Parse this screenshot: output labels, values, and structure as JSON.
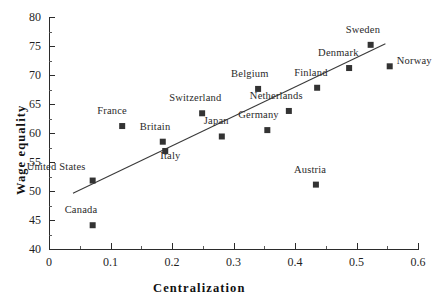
{
  "chart_data": {
    "type": "scatter",
    "title": "",
    "xlabel": "Centralization",
    "ylabel": "Wage equality",
    "xlim": [
      0,
      0.6
    ],
    "ylim": [
      40,
      80
    ],
    "xticks": [
      "0",
      "0.1",
      "0.2",
      "0.3",
      "0.4",
      "0.5",
      "0.6"
    ],
    "xtick_values": [
      0,
      0.1,
      0.2,
      0.3,
      0.4,
      0.5,
      0.6
    ],
    "yticks": [
      "40",
      "45",
      "50",
      "55",
      "60",
      "65",
      "70",
      "75",
      "80"
    ],
    "ytick_values": [
      40,
      45,
      50,
      55,
      60,
      65,
      70,
      75,
      80
    ],
    "minor_ticks": true,
    "grid": false,
    "legend": "none",
    "marker_color": "#333333",
    "trendline": {
      "x": [
        0.039,
        0.547
      ],
      "y": [
        49.6,
        75.4
      ]
    },
    "points": [
      {
        "label": "Canada",
        "x": 0.071,
        "y": 44.1,
        "label_dx": -28,
        "label_dy": -14
      },
      {
        "label": "United States",
        "x": 0.071,
        "y": 51.8,
        "label_dx": -66,
        "label_dy": -13
      },
      {
        "label": "France",
        "x": 0.119,
        "y": 61.2,
        "label_dx": -25,
        "label_dy": -14
      },
      {
        "label": "Britain",
        "x": 0.185,
        "y": 58.5,
        "label_dx": -23,
        "label_dy": -14
      },
      {
        "label": "Italy",
        "x": 0.189,
        "y": 56.9,
        "label_dx": -5,
        "label_dy": 6
      },
      {
        "label": "Switzerland",
        "x": 0.249,
        "y": 63.4,
        "label_dx": -33,
        "label_dy": -14
      },
      {
        "label": "Japan",
        "x": 0.281,
        "y": 59.4,
        "label_dx": -18,
        "label_dy": -14
      },
      {
        "label": "Belgium",
        "x": 0.34,
        "y": 67.6,
        "label_dx": -27,
        "label_dy": -14
      },
      {
        "label": "Germany",
        "x": 0.355,
        "y": 60.5,
        "label_dx": -29,
        "label_dy": -14
      },
      {
        "label": "Netherlands",
        "x": 0.39,
        "y": 63.8,
        "label_dx": -39,
        "label_dy": -14
      },
      {
        "label": "Austria",
        "x": 0.434,
        "y": 51.1,
        "label_dx": -22,
        "label_dy": -14
      },
      {
        "label": "Finland",
        "x": 0.436,
        "y": 67.8,
        "label_dx": -23,
        "label_dy": -14
      },
      {
        "label": "Denmark",
        "x": 0.488,
        "y": 71.2,
        "label_dx": -31,
        "label_dy": -14
      },
      {
        "label": "Sweden",
        "x": 0.523,
        "y": 75.2,
        "label_dx": -25,
        "label_dy": -14
      },
      {
        "label": "Norway",
        "x": 0.554,
        "y": 71.5,
        "label_dx": 7,
        "label_dy": -4
      }
    ]
  }
}
